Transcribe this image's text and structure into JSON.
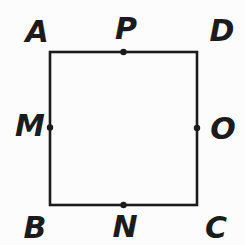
{
  "figure": {
    "background": "#fcfcfc",
    "line_color": "#1b1b1b",
    "square": {
      "x": 50,
      "y": 52,
      "width": 147,
      "height": 153,
      "stroke_width": 2.6
    },
    "dot_radius": 3.2,
    "corners": [
      {
        "label": "A",
        "position": "top-left",
        "label_x": 37,
        "label_y": 32
      },
      {
        "label": "D",
        "position": "top-right",
        "label_x": 222,
        "label_y": 31
      },
      {
        "label": "B",
        "position": "bottom-left",
        "label_x": 35,
        "label_y": 228
      },
      {
        "label": "C",
        "position": "bottom-right",
        "label_x": 216,
        "label_y": 228
      }
    ],
    "midpoints": [
      {
        "label": "P",
        "side": "top",
        "dot_x": 123.5,
        "dot_y": 52,
        "label_x": 126,
        "label_y": 29
      },
      {
        "label": "M",
        "side": "left",
        "dot_x": 50,
        "dot_y": 127.5,
        "label_x": 30,
        "label_y": 126
      },
      {
        "label": "O",
        "side": "right",
        "dot_x": 197,
        "dot_y": 128,
        "label_x": 223,
        "label_y": 129
      },
      {
        "label": "N",
        "side": "bottom",
        "dot_x": 123.5,
        "dot_y": 205,
        "label_x": 125,
        "label_y": 227
      }
    ]
  }
}
